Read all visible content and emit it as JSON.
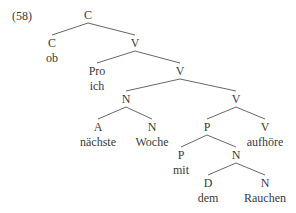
{
  "example_number": "(58)",
  "tree": {
    "nodes": [
      {
        "id": "c0",
        "label": "C",
        "x": 88,
        "y": 9
      },
      {
        "id": "c1",
        "label": "C",
        "word": "ob",
        "x": 52,
        "y": 37
      },
      {
        "id": "v1",
        "label": "V",
        "x": 135,
        "y": 37
      },
      {
        "id": "pro",
        "label": "Pro",
        "word": "ich",
        "x": 97,
        "y": 65
      },
      {
        "id": "v2",
        "label": "V",
        "x": 180,
        "y": 65
      },
      {
        "id": "n1",
        "label": "N",
        "x": 126,
        "y": 93
      },
      {
        "id": "v3",
        "label": "V",
        "x": 236,
        "y": 93
      },
      {
        "id": "a",
        "label": "A",
        "word": "nächste",
        "x": 98,
        "y": 121
      },
      {
        "id": "n2",
        "label": "N",
        "word": "Woche",
        "x": 152,
        "y": 121
      },
      {
        "id": "p1",
        "label": "P",
        "x": 207,
        "y": 121
      },
      {
        "id": "v4",
        "label": "V",
        "word": "aufhöre",
        "x": 265,
        "y": 121
      },
      {
        "id": "p2",
        "label": "P",
        "word": "mit",
        "x": 181,
        "y": 149
      },
      {
        "id": "n3",
        "label": "N",
        "x": 236,
        "y": 149
      },
      {
        "id": "d",
        "label": "D",
        "word": "dem",
        "x": 208,
        "y": 177
      },
      {
        "id": "n4",
        "label": "N",
        "word": "Rauchen",
        "x": 265,
        "y": 177
      }
    ],
    "edges": [
      [
        "c0",
        "c1"
      ],
      [
        "c0",
        "v1"
      ],
      [
        "v1",
        "pro"
      ],
      [
        "v1",
        "v2"
      ],
      [
        "v2",
        "n1"
      ],
      [
        "v2",
        "v3"
      ],
      [
        "n1",
        "a"
      ],
      [
        "n1",
        "n2"
      ],
      [
        "v3",
        "p1"
      ],
      [
        "v3",
        "v4"
      ],
      [
        "p1",
        "p2"
      ],
      [
        "p1",
        "n3"
      ],
      [
        "n3",
        "d"
      ],
      [
        "n3",
        "n4"
      ]
    ]
  }
}
